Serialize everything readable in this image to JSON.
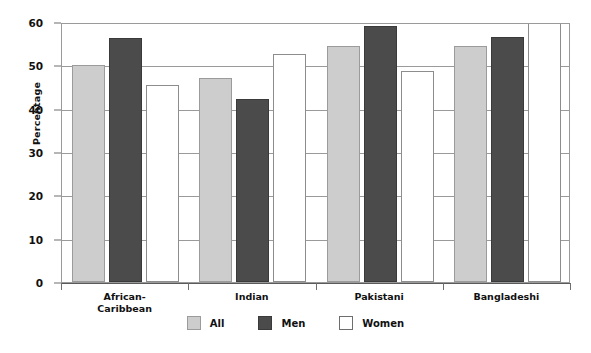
{
  "chart_data": {
    "type": "bar",
    "title": "",
    "subtitle": "",
    "xlabel": "",
    "ylabel": "Percentage",
    "ylim": [
      0,
      60
    ],
    "yticks": [
      0,
      10,
      20,
      30,
      40,
      50,
      60
    ],
    "ytick_labels": [
      "0",
      "10",
      "20",
      "30",
      "40",
      "50",
      "60"
    ],
    "grid": true,
    "grid_axis": "y",
    "legend_position": "bottom-center",
    "categories": [
      "African-\nCaribbean",
      "Indian",
      "Pakistani",
      "Bangladeshi"
    ],
    "category_labels_flat": [
      "African-Caribbean",
      "Indian",
      "Pakistani",
      "Bangladeshi"
    ],
    "series": [
      {
        "name": "All",
        "color": "#cdcdcd",
        "values": [
          50.0,
          47.0,
          54.5,
          54.5
        ]
      },
      {
        "name": "Men",
        "color": "#4b4b4b",
        "values": [
          56.3,
          42.2,
          59.0,
          56.5
        ]
      },
      {
        "name": "Women",
        "color": "#ffffff",
        "values": [
          45.5,
          52.7,
          48.6,
          62.0
        ]
      }
    ]
  },
  "legend": {
    "entries": [
      {
        "label": "All",
        "swatch": "series-all"
      },
      {
        "label": "Men",
        "swatch": "series-men"
      },
      {
        "label": "Women",
        "swatch": "series-women"
      }
    ]
  }
}
